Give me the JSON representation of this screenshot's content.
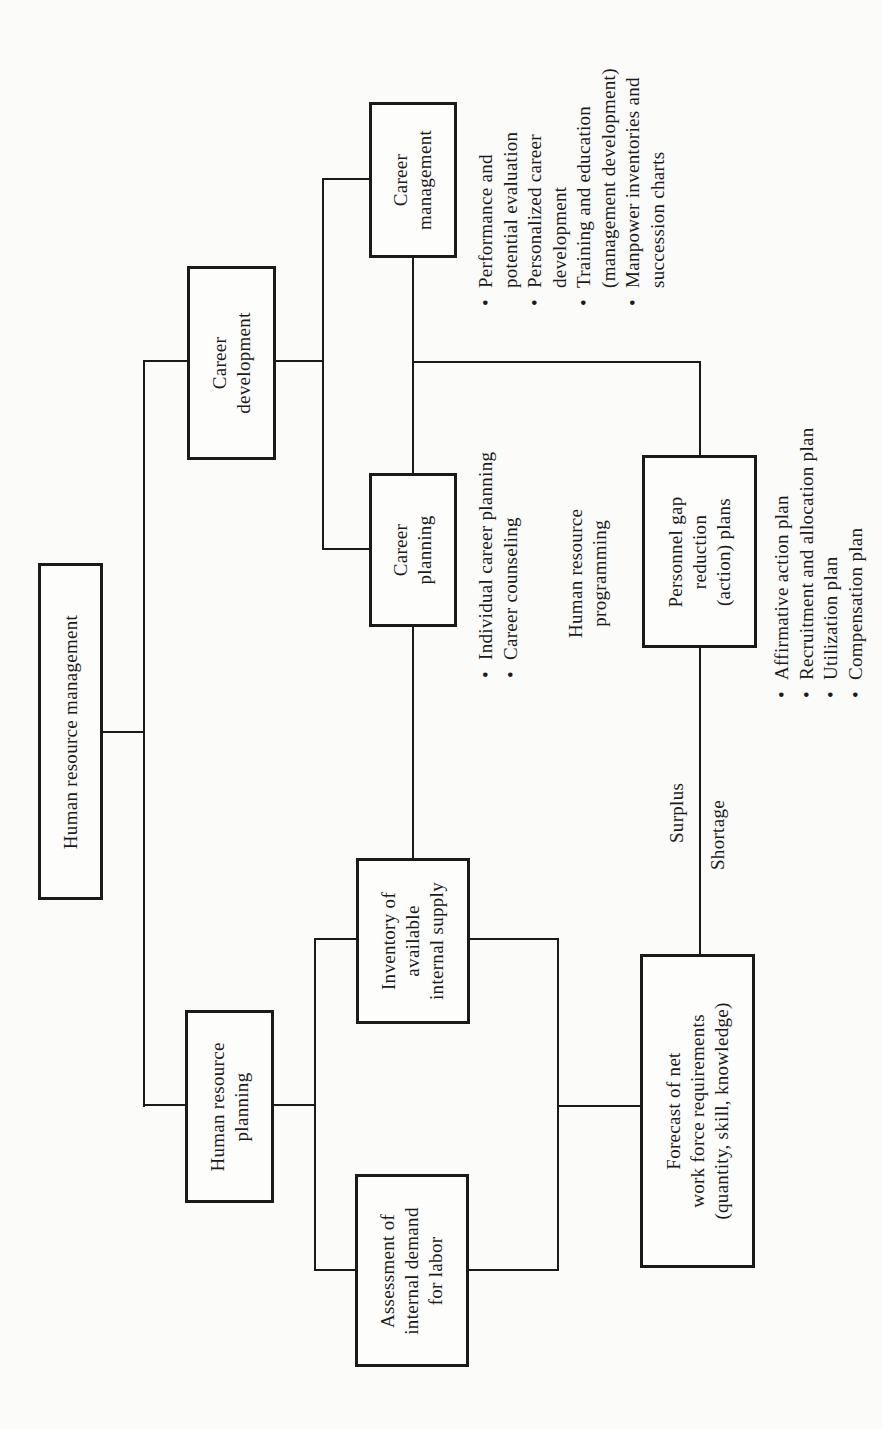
{
  "diagram": {
    "orientation": "rotated 90 degrees counter-clockwise",
    "nodes": {
      "hrm": {
        "lines": [
          "Human resource management"
        ]
      },
      "career_development": {
        "lines": [
          "Career",
          "development"
        ]
      },
      "career_management": {
        "lines": [
          "Career",
          "management"
        ]
      },
      "career_planning": {
        "lines": [
          "Career",
          "planning"
        ]
      },
      "personnel_gap": {
        "lines": [
          "Personnel gap",
          "reduction",
          "(action) plans"
        ]
      },
      "hr_planning": {
        "lines": [
          "Human resource",
          "planning"
        ]
      },
      "inventory": {
        "lines": [
          "Inventory of",
          "available",
          "internal supply"
        ]
      },
      "assessment": {
        "lines": [
          "Assessment of",
          "internal demand",
          "for labor"
        ]
      },
      "forecast": {
        "lines": [
          "Forecast of net",
          "work force requirements",
          "(quantity, skill, knowledge)"
        ]
      }
    },
    "labels": {
      "hr_programming": [
        "Human resource",
        "programming"
      ],
      "surplus": "Surplus",
      "shortage": "Shortage"
    },
    "lists": {
      "career_management_items": [
        {
          "bullet": "•",
          "lines": [
            "Performance and",
            "potential evaluation"
          ]
        },
        {
          "bullet": "•",
          "lines": [
            "Personalized career",
            "development"
          ]
        },
        {
          "bullet": "•",
          "lines": [
            "Training and education",
            "(management development)"
          ]
        },
        {
          "bullet": "•",
          "lines": [
            "Manpower inventories and",
            "succession charts"
          ]
        }
      ],
      "career_planning_items": [
        {
          "bullet": "•",
          "lines": [
            "Individual career planning"
          ]
        },
        {
          "bullet": "•",
          "lines": [
            "Career counseling"
          ]
        }
      ],
      "gap_plan_items": [
        {
          "bullet": "•",
          "lines": [
            "Affirmative action plan"
          ]
        },
        {
          "bullet": "•",
          "lines": [
            "Recruitment and allocation plan"
          ]
        },
        {
          "bullet": "•",
          "lines": [
            "Utilization plan"
          ]
        },
        {
          "bullet": "•",
          "lines": [
            "Compensation plan"
          ]
        }
      ]
    },
    "colors": {
      "ink": "#1a1a1a",
      "paper": "#fbfbfa"
    }
  }
}
